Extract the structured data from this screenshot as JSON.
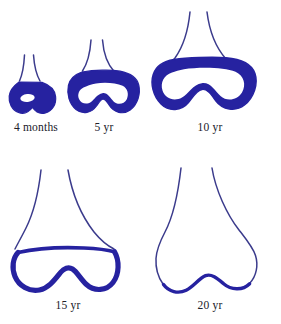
{
  "illustration": {
    "title": "Ossification of the distal femur",
    "background_color": "#ffffff",
    "bone_outline_color": "#3b3b8c",
    "cartilage_color": "#2622a0",
    "label_color": "#20202a"
  },
  "stages": [
    {
      "id": "stage-4-months",
      "label": "4 months",
      "age_value": 4,
      "age_unit": "months",
      "cartilage_state": "filled",
      "ossification_center": "small-oval",
      "x": 7,
      "y": 52,
      "width": 58,
      "height": 68,
      "label_x": 3,
      "label_y": 122,
      "label_width": 66
    },
    {
      "id": "stage-5-yr",
      "label": "5 yr",
      "age_value": 5,
      "age_unit": "yr",
      "cartilage_state": "filled",
      "ossification_center": "medium-peanut",
      "x": 66,
      "y": 38,
      "width": 76,
      "height": 82,
      "label_x": 82,
      "label_y": 122,
      "label_width": 44
    },
    {
      "id": "stage-10-yr",
      "label": "10 yr",
      "age_value": 10,
      "age_unit": "yr",
      "cartilage_state": "filled",
      "ossification_center": "large-peanut",
      "x": 152,
      "y": 12,
      "width": 116,
      "height": 108,
      "label_x": 186,
      "label_y": 122,
      "label_width": 48
    },
    {
      "id": "stage-15-yr",
      "label": "15 yr",
      "age_value": 15,
      "age_unit": "yr",
      "cartilage_state": "thin-rim",
      "ossification_center": "nearly-complete",
      "x": 12,
      "y": 168,
      "width": 116,
      "height": 126,
      "label_x": 44,
      "label_y": 300,
      "label_width": 48
    },
    {
      "id": "stage-20-yr",
      "label": "20 yr",
      "age_value": 20,
      "age_unit": "yr",
      "cartilage_state": "fused",
      "ossification_center": "complete",
      "x": 152,
      "y": 168,
      "width": 116,
      "height": 126,
      "label_x": 186,
      "label_y": 300,
      "label_width": 48
    }
  ]
}
